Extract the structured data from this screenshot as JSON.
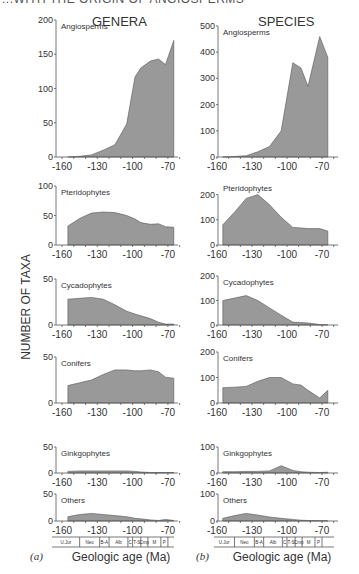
{
  "header": {
    "cut_title": "...WITH THE ORIGIN OF ANGIOSPERMS"
  },
  "columns": [
    {
      "title": "GENERA",
      "sublabel": "(a)"
    },
    {
      "title": "SPECIES",
      "sublabel": "(b)"
    }
  ],
  "ylabel": "NUMBER OF TAXA",
  "xlabel": "Geologic age (Ma)",
  "x_ticks": [
    -160,
    -130,
    -100,
    -70
  ],
  "stages": [
    "U.Jur",
    "Neo",
    "B-A",
    "Alb",
    "C",
    "T-S",
    "Cmp",
    "M",
    "P"
  ],
  "colors": {
    "fill": "#999999",
    "stroke": "#555555",
    "axis": "#555555",
    "text": "#333333"
  },
  "chart_data": [
    {
      "type": "area",
      "title": "GENERA",
      "xlabel": "Geologic age (Ma)",
      "ylabel": "NUMBER OF TAXA",
      "x": [
        -155,
        -145,
        -135,
        -125,
        -115,
        -105,
        -98,
        -93,
        -85,
        -78,
        -72,
        -65
      ],
      "panels": [
        {
          "name": "Angiosperms",
          "ylim": [
            0,
            200
          ],
          "yticks": [
            0,
            50,
            100,
            150,
            200
          ],
          "values": [
            0,
            1,
            3,
            10,
            18,
            48,
            117,
            130,
            140,
            143,
            135,
            170
          ]
        },
        {
          "name": "Pteridophytes",
          "ylim": [
            0,
            100
          ],
          "yticks": [
            0,
            50,
            100
          ],
          "values": [
            32,
            45,
            54,
            56,
            55,
            50,
            44,
            38,
            35,
            36,
            31,
            30
          ]
        },
        {
          "name": "Cycadophytes",
          "ylim": [
            0,
            50
          ],
          "yticks": [
            0,
            50
          ],
          "values": [
            28,
            29,
            30,
            28,
            22,
            15,
            12,
            10,
            7,
            3,
            1,
            1
          ]
        },
        {
          "name": "Conifers",
          "ylim": [
            0,
            50
          ],
          "yticks": [
            0,
            50
          ],
          "values": [
            19,
            22,
            25,
            31,
            36,
            36,
            35,
            35,
            36,
            34,
            28,
            27
          ]
        },
        {
          "name": "Ginkgophytes",
          "ylim": [
            0,
            50
          ],
          "yticks": [
            0,
            50
          ],
          "values": [
            3,
            4,
            4,
            4,
            4,
            4,
            3,
            2,
            1,
            1,
            1,
            1
          ]
        },
        {
          "name": "Others",
          "ylim": [
            0,
            50
          ],
          "yticks": [
            0,
            50
          ],
          "values": [
            8,
            12,
            14,
            12,
            10,
            8,
            5,
            4,
            2,
            1,
            3,
            1
          ]
        }
      ]
    },
    {
      "type": "area",
      "title": "SPECIES",
      "xlabel": "Geologic age (Ma)",
      "ylabel": "NUMBER OF TAXA",
      "x": [
        -155,
        -145,
        -135,
        -125,
        -115,
        -105,
        -95,
        -88,
        -82,
        -72,
        -65
      ],
      "panels": [
        {
          "name": "Angiosperms",
          "ylim": [
            0,
            500
          ],
          "yticks": [
            0,
            100,
            200,
            300,
            400,
            500
          ],
          "values": [
            0,
            2,
            5,
            20,
            40,
            100,
            360,
            340,
            270,
            460,
            380
          ]
        },
        {
          "name": "Pteridophytes",
          "ylim": [
            0,
            250
          ],
          "yticks": [
            0,
            100,
            200
          ],
          "values": [
            80,
            130,
            185,
            200,
            160,
            110,
            70,
            68,
            65,
            65,
            55
          ]
        },
        {
          "name": "Cycadophytes",
          "ylim": [
            0,
            200
          ],
          "yticks": [
            0,
            100,
            200
          ],
          "values": [
            100,
            110,
            120,
            100,
            70,
            40,
            12,
            10,
            8,
            2,
            1
          ]
        },
        {
          "name": "Conifers",
          "ylim": [
            0,
            200
          ],
          "yticks": [
            0,
            100,
            200
          ],
          "values": [
            60,
            62,
            65,
            85,
            100,
            100,
            75,
            70,
            50,
            20,
            50
          ]
        },
        {
          "name": "Ginkgophytes",
          "ylim": [
            0,
            100
          ],
          "yticks": [
            0,
            100
          ],
          "values": [
            5,
            5,
            6,
            6,
            8,
            28,
            10,
            5,
            3,
            2,
            3
          ]
        },
        {
          "name": "Others",
          "ylim": [
            0,
            100
          ],
          "yticks": [
            0,
            100
          ],
          "values": [
            10,
            20,
            28,
            22,
            15,
            10,
            6,
            3,
            2,
            1,
            1
          ]
        }
      ]
    }
  ]
}
